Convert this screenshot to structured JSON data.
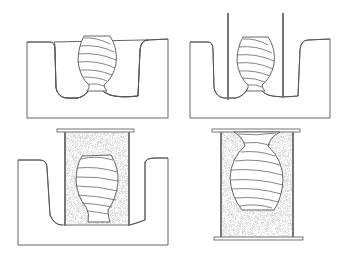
{
  "figure": {
    "panels": [
      {
        "id": "panel-1",
        "step": 1,
        "content": "vase pattern sitting in hatched ground pit"
      },
      {
        "id": "panel-2",
        "step": 2,
        "content": "two vertical rods placed either side of vase in pit"
      },
      {
        "id": "panel-3",
        "step": 3,
        "content": "flask with stippled sand packed around vase in pit, top plate"
      },
      {
        "id": "panel-4",
        "step": 4,
        "content": "flask lifted and inverted with vase embedded in sand, top and bottom plates"
      }
    ],
    "colors": {
      "line": "#555555",
      "background": "#ffffff",
      "sand": "#d8d8d8"
    }
  }
}
